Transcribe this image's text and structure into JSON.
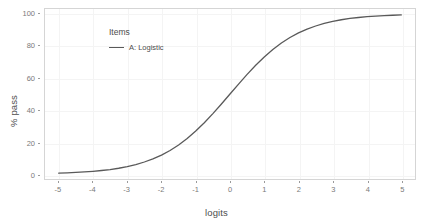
{
  "chart_data": {
    "type": "line",
    "title": "",
    "xlabel": "logits",
    "ylabel": "% pass",
    "xlim": [
      -5.4,
      5.4
    ],
    "ylim": [
      -3,
      103
    ],
    "xticks": [
      -5,
      -4,
      -3,
      -2,
      -1,
      0,
      1,
      2,
      3,
      4,
      5
    ],
    "xtick_labels": [
      "-5",
      "-4",
      "-3",
      "-2",
      "-1",
      "0",
      "1",
      "2",
      "3",
      "4",
      "5"
    ],
    "yticks": [
      0,
      20,
      40,
      60,
      80,
      100
    ],
    "ytick_labels": [
      "0",
      "20",
      "40",
      "60",
      "80",
      "100"
    ],
    "grid": true,
    "legend": {
      "title": "Items",
      "position": "inside-top-left",
      "entries": [
        {
          "label": "A: Logistic",
          "color": "#595959",
          "style": "solid"
        }
      ]
    },
    "series": [
      {
        "name": "A: Logistic",
        "color": "#595959",
        "formula": "100 / (1 + exp(-x))",
        "x": [
          -5,
          -4.75,
          -4.5,
          -4.25,
          -4,
          -3.75,
          -3.5,
          -3.25,
          -3,
          -2.75,
          -2.5,
          -2.25,
          -2,
          -1.75,
          -1.5,
          -1.25,
          -1,
          -0.75,
          -0.5,
          -0.25,
          0,
          0.25,
          0.5,
          0.75,
          1,
          1.25,
          1.5,
          1.75,
          2,
          2.25,
          2.5,
          2.75,
          3,
          3.25,
          3.5,
          3.75,
          4,
          4.25,
          4.5,
          4.75,
          5
        ],
        "values": [
          0.67,
          0.86,
          1.1,
          1.4,
          1.8,
          2.3,
          2.9,
          3.7,
          4.7,
          6.0,
          7.6,
          9.5,
          11.9,
          14.8,
          18.2,
          22.3,
          26.9,
          32.1,
          37.8,
          43.8,
          50.0,
          56.2,
          62.2,
          67.9,
          73.1,
          77.7,
          81.8,
          85.2,
          88.1,
          90.5,
          92.4,
          94.0,
          95.3,
          96.3,
          97.1,
          97.7,
          98.2,
          98.6,
          98.9,
          99.1,
          99.3
        ]
      }
    ]
  },
  "style": {
    "panel_background": "#ffffff",
    "panel_border": "#d5d5d5",
    "gridline_color": "#f4f4f4",
    "axis_text_color": "#7a7a7a",
    "axis_title_color": "#4d4d4d",
    "page_background": "#ffffff"
  }
}
